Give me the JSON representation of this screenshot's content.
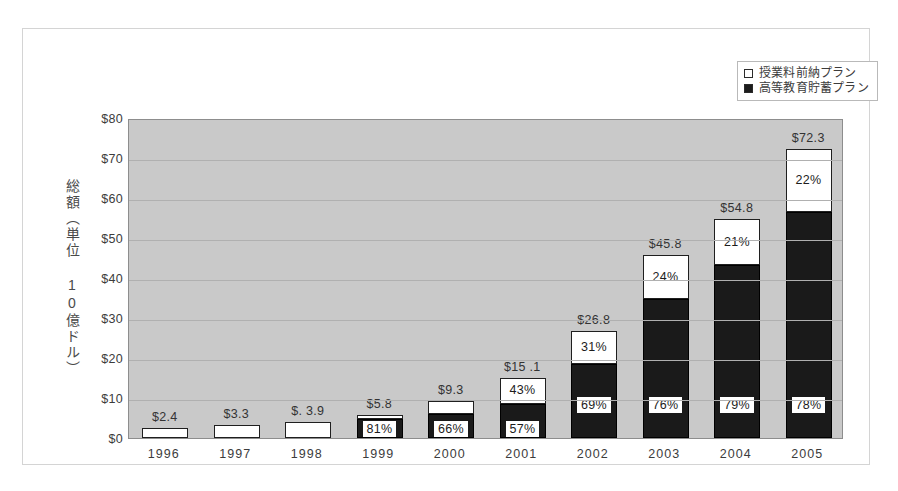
{
  "legend": {
    "position": "top-right",
    "items": [
      {
        "label": "授業料前納プラン",
        "swatch": "white",
        "icon": "white-square-icon"
      },
      {
        "label": "高等教育貯蓄プラン",
        "swatch": "black",
        "icon": "black-square-icon"
      }
    ]
  },
  "axes": {
    "y_title": "総額（単位 10億ドル）",
    "y_ticks": [
      "$80",
      "$70",
      "$60",
      "$50",
      "$40",
      "$30",
      "$20",
      "$10",
      "$0"
    ]
  },
  "chart_data": {
    "type": "bar",
    "subtype": "stacked-column",
    "title": "",
    "xlabel": "",
    "ylabel": "総額（単位 10億ドル）",
    "ylim": [
      0,
      80
    ],
    "ytick_step": 10,
    "grid": true,
    "categories": [
      "1996",
      "1997",
      "1998",
      "1999",
      "2000",
      "2001",
      "2002",
      "2003",
      "2004",
      "2005"
    ],
    "series": [
      {
        "name": "高等教育貯蓄プラン",
        "color": "#1a1a1a",
        "values": [
          0.0,
          0.0,
          0.0,
          4.7,
          6.1,
          8.6,
          18.5,
          34.8,
          43.3,
          56.4
        ],
        "labels": [
          "",
          "",
          "",
          "81%",
          "66%",
          "57%",
          "69%",
          "76%",
          "79%",
          "78%"
        ]
      },
      {
        "name": "授業料前納プラン",
        "color": "#ffffff",
        "values": [
          2.4,
          3.3,
          3.9,
          1.1,
          3.2,
          6.5,
          8.3,
          11.0,
          11.5,
          15.9
        ],
        "labels": [
          "",
          "",
          "",
          "",
          "",
          "43%",
          "31%",
          "24%",
          "21%",
          "22%"
        ]
      }
    ],
    "totals": [
      "$2.4",
      "$3.3",
      "$. 3.9",
      "$5.8",
      "$9.3",
      "$15 .1",
      "$26.8",
      "$45.8",
      "$54.8",
      "$72.3"
    ],
    "total_values": [
      2.4,
      3.3,
      3.9,
      5.8,
      9.3,
      15.1,
      26.8,
      45.8,
      54.8,
      72.3
    ]
  },
  "bars": [
    {
      "year": "1996",
      "total": "$2.4",
      "total_value": 2.4,
      "black_value": 0.0,
      "white_value": 2.4,
      "black_pct": "",
      "white_pct": ""
    },
    {
      "year": "1997",
      "total": "$3.3",
      "total_value": 3.3,
      "black_value": 0.0,
      "white_value": 3.3,
      "black_pct": "",
      "white_pct": ""
    },
    {
      "year": "1998",
      "total": "$. 3.9",
      "total_value": 3.9,
      "black_value": 0.0,
      "white_value": 3.9,
      "black_pct": "",
      "white_pct": ""
    },
    {
      "year": "1999",
      "total": "$5.8",
      "total_value": 5.8,
      "black_value": 4.7,
      "white_value": 1.1,
      "black_pct": "81%",
      "white_pct": ""
    },
    {
      "year": "2000",
      "total": "$9.3",
      "total_value": 9.3,
      "black_value": 6.1,
      "white_value": 3.2,
      "black_pct": "66%",
      "white_pct": ""
    },
    {
      "year": "2001",
      "total": "$15 .1",
      "total_value": 15.1,
      "black_value": 8.6,
      "white_value": 6.5,
      "black_pct": "57%",
      "white_pct": "43%"
    },
    {
      "year": "2002",
      "total": "$26.8",
      "total_value": 26.8,
      "black_value": 18.5,
      "white_value": 8.3,
      "black_pct": "69%",
      "white_pct": "31%"
    },
    {
      "year": "2003",
      "total": "$45.8",
      "total_value": 45.8,
      "black_value": 34.8,
      "white_value": 11.0,
      "black_pct": "76%",
      "white_pct": "24%"
    },
    {
      "year": "2004",
      "total": "$54.8",
      "total_value": 54.8,
      "black_value": 43.3,
      "white_value": 11.5,
      "black_pct": "79%",
      "white_pct": "21%"
    },
    {
      "year": "2005",
      "total": "$72.3",
      "total_value": 72.3,
      "black_value": 56.4,
      "white_value": 15.9,
      "black_pct": "78%",
      "white_pct": "22%"
    }
  ],
  "colors": {
    "plot_background": "#c9c9c9",
    "page_background": "#ffffff",
    "series_black": "#1a1a1a",
    "series_white": "#ffffff",
    "gridline": "#b0b0b0",
    "frame_border": "#d4d4d4"
  }
}
